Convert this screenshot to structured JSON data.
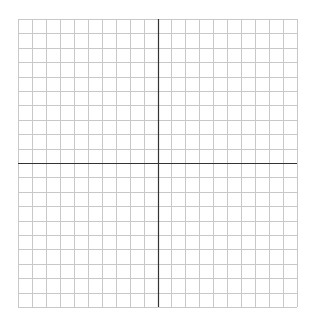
{
  "diagram": {
    "type": "coordinate-grid",
    "columns": 20,
    "rows": 20,
    "origin": {
      "col": 10,
      "row": 10
    },
    "bounds": {
      "left": 18,
      "top": 19,
      "right": 297,
      "bottom": 307
    },
    "colors": {
      "background": "#ffffff",
      "grid_line": "#c8c8c8",
      "axis_line": "#333333"
    },
    "labels": []
  }
}
